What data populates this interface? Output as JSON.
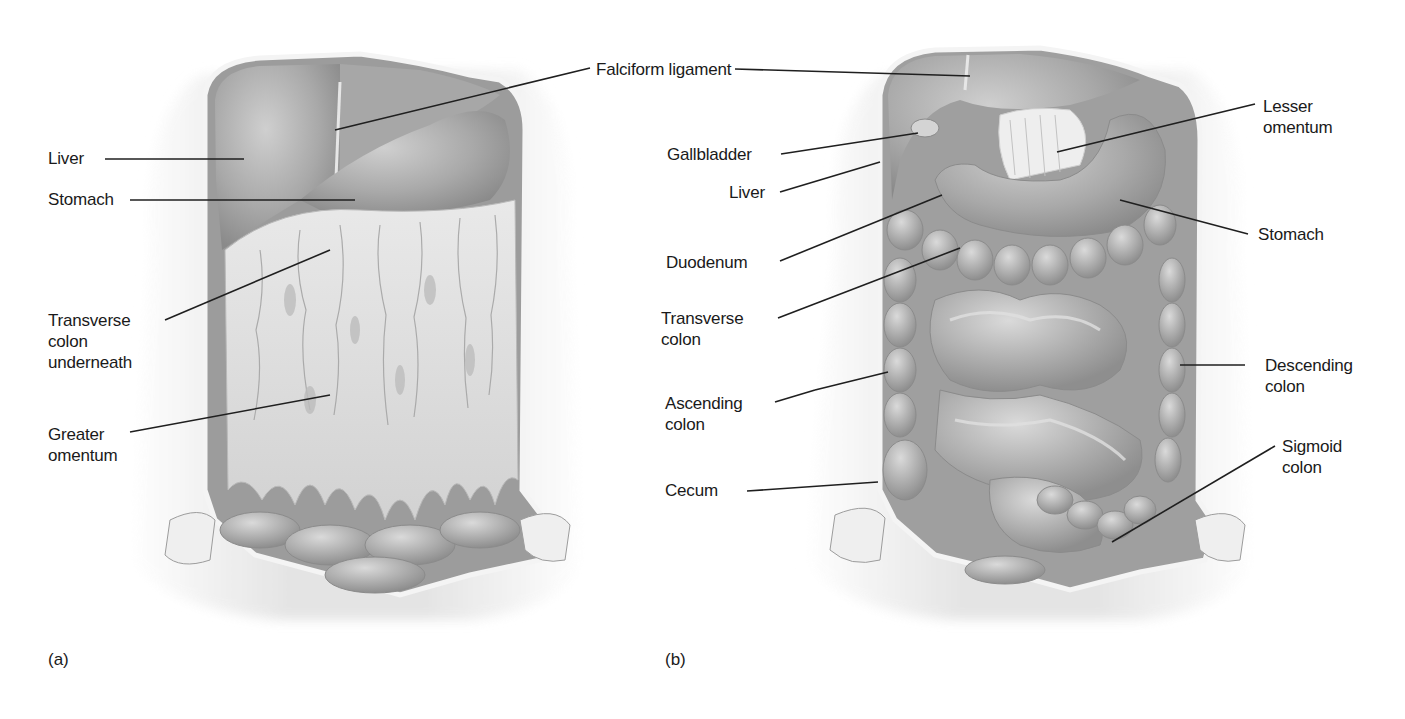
{
  "figure": {
    "panels": [
      {
        "id": "a",
        "letter": "(a)",
        "view": "Anterior abdominal cavity with greater omentum in place",
        "labels": [
          {
            "text": "Liver",
            "x": 48,
            "y": 147
          },
          {
            "text": "Stomach",
            "x": 48,
            "y": 189
          },
          {
            "text": "Transverse\ncolon\nunderneath",
            "x": 48,
            "y": 310
          },
          {
            "text": "Greater\nomentum",
            "x": 48,
            "y": 424
          },
          {
            "text": "Falciform ligament",
            "x": 596,
            "y": 61
          }
        ]
      },
      {
        "id": "b",
        "letter": "(b)",
        "view": "Abdominal cavity with greater omentum removed",
        "labels": [
          {
            "text": "Gallbladder",
            "x": 667,
            "y": 145
          },
          {
            "text": "Liver",
            "x": 729,
            "y": 183
          },
          {
            "text": "Lesser\nomentum",
            "x": 1263,
            "y": 96
          },
          {
            "text": "Stomach",
            "x": 1258,
            "y": 225
          },
          {
            "text": "Duodenum",
            "x": 666,
            "y": 253
          },
          {
            "text": "Transverse\ncolon",
            "x": 661,
            "y": 308
          },
          {
            "text": "Descending\ncolon",
            "x": 1265,
            "y": 355
          },
          {
            "text": "Ascending\ncolon",
            "x": 665,
            "y": 393
          },
          {
            "text": "Sigmoid\ncolon",
            "x": 1282,
            "y": 436
          },
          {
            "text": "Cecum",
            "x": 665,
            "y": 481
          }
        ]
      }
    ],
    "colors": {
      "background": "#ffffff",
      "label_text": "#1a1a1a",
      "leader_line": "#1f1f1f",
      "tissue_dark": "#8c8c8c",
      "tissue_mid": "#b4b4b4",
      "tissue_light": "#d8d8d8",
      "omentum": "#e4e4e4",
      "skin": "#eeeeee"
    }
  }
}
